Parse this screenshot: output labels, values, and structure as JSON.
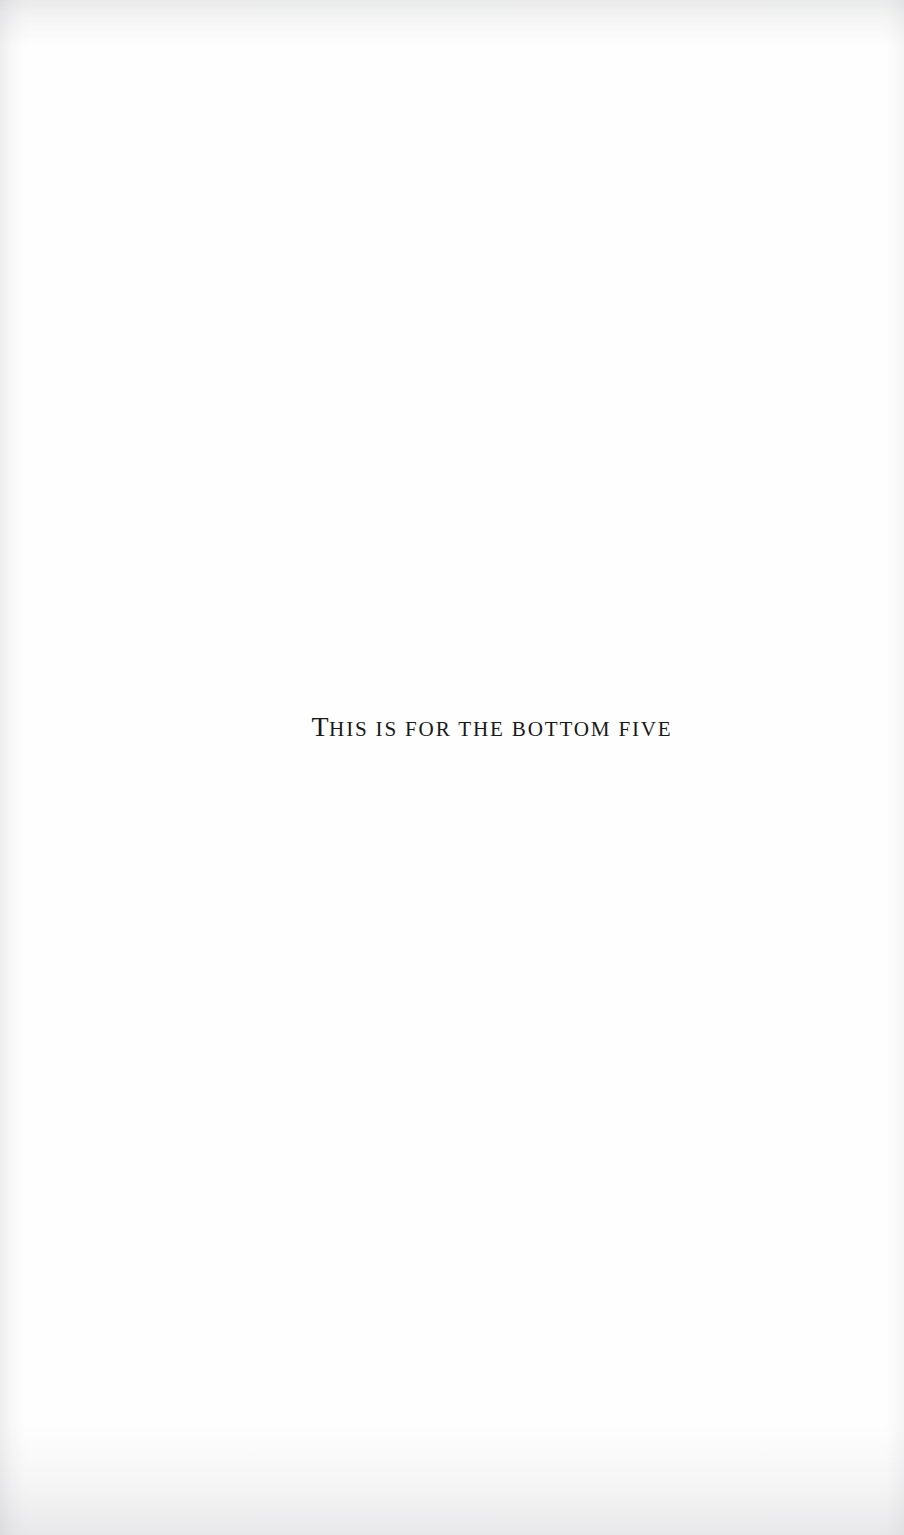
{
  "document": {
    "page_type": "dedication",
    "background_color": "#fefefe",
    "text_color": "#191919",
    "dedication": {
      "full_text": "THIS IS FOR THE BOTTOM FIVE",
      "lead_cap": "T",
      "remainder": "HIS IS FOR THE BOTTOM FIVE",
      "words": [
        "THIS",
        "IS",
        "FOR",
        "THE",
        "BOTTOM",
        "FIVE"
      ],
      "style": "small-caps serif, letterspaced, centered"
    }
  }
}
